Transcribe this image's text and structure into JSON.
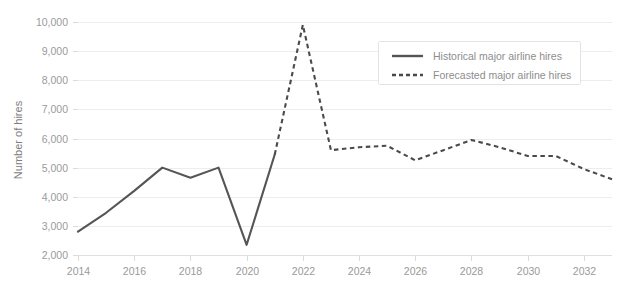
{
  "chart_data": {
    "type": "line",
    "title": "",
    "xlabel": "",
    "ylabel": "Number of hires",
    "xlim": [
      2014,
      2033
    ],
    "ylim": [
      2000,
      10000
    ],
    "grid": "horizontal",
    "legend_position": "upper-right",
    "x_ticks": [
      "2014",
      "2016",
      "2018",
      "2020",
      "2022",
      "2024",
      "2026",
      "2028",
      "2030",
      "2032"
    ],
    "y_ticks": [
      "2,000",
      "3,000",
      "4,000",
      "5,000",
      "6,000",
      "7,000",
      "8,000",
      "9,000",
      "10,000"
    ],
    "series": [
      {
        "name": "Historical major airline hires",
        "style": "solid",
        "color": "#555555",
        "x": [
          2014,
          2015,
          2016,
          2017,
          2018,
          2019,
          2020,
          2021
        ],
        "values": [
          2800,
          3450,
          4200,
          5000,
          4650,
          5000,
          2350,
          5450
        ]
      },
      {
        "name": "Forecasted major airline hires",
        "style": "dotted",
        "color": "#4a4a4a",
        "x": [
          2021,
          2022,
          2023,
          2024,
          2025,
          2026,
          2027,
          2028,
          2029,
          2030,
          2031,
          2032,
          2033
        ],
        "values": [
          5450,
          9900,
          5600,
          5700,
          5750,
          5250,
          5600,
          5950,
          5700,
          5400,
          5400,
          4950,
          4600
        ]
      }
    ]
  },
  "legend": {
    "items": [
      {
        "label": "Historical major airline hires",
        "style": "solid"
      },
      {
        "label": "Forecasted major airline hires",
        "style": "dotted"
      }
    ]
  },
  "axes": {
    "y_title": "Number of hires"
  }
}
